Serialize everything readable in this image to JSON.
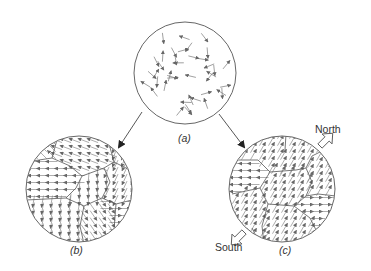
{
  "diagram": {
    "colors": {
      "line": "#555555",
      "arrow": "#777777",
      "background": "#ffffff"
    },
    "panels": [
      {
        "id": "a",
        "label": "a",
        "description": "Randomly oriented atomic magnetic moments",
        "center": [
          185,
          73
        ],
        "radius": 51
      },
      {
        "id": "b",
        "label": "b",
        "description": "Domains with random net orientation (unmagnetized)",
        "center": [
          79,
          189
        ],
        "radius": 53
      },
      {
        "id": "c",
        "label": "c",
        "description": "Domains aligned toward North (magnetized)",
        "center": [
          282,
          189
        ],
        "radius": 53
      }
    ],
    "flow_arrows": [
      {
        "from": "a",
        "to": "b"
      },
      {
        "from": "a",
        "to": "c"
      }
    ],
    "pole_labels": {
      "north": "North",
      "south": "South"
    }
  }
}
